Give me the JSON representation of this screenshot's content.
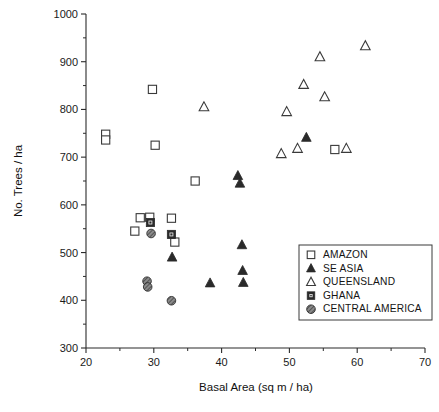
{
  "chart_data": {
    "type": "scatter",
    "title": "",
    "xlabel": "Basal Area (sq m / ha)",
    "ylabel": "No. Trees / ha",
    "xlim": [
      20,
      70
    ],
    "ylim": [
      300,
      1000
    ],
    "xticks": [
      20,
      30,
      40,
      50,
      60,
      70
    ],
    "xtick_labels": [
      "20",
      "30",
      "40",
      "50",
      "60",
      "70"
    ],
    "xminor_step": 5,
    "yticks": [
      300,
      400,
      500,
      600,
      700,
      800,
      900,
      1000
    ],
    "ytick_labels": [
      "300",
      "400",
      "500",
      "600",
      "700",
      "800",
      "900",
      "1000"
    ],
    "yminor_step": 50,
    "grid": false,
    "legend_position": "lower-right",
    "series": [
      {
        "name": "AMAZON",
        "marker": "open-square",
        "color": "#ffffff",
        "edge_color": "#3a3a3a",
        "points": [
          {
            "x": 22.9,
            "y": 748
          },
          {
            "x": 22.9,
            "y": 736
          },
          {
            "x": 29.8,
            "y": 842
          },
          {
            "x": 30.2,
            "y": 725
          },
          {
            "x": 36.1,
            "y": 650
          },
          {
            "x": 28.0,
            "y": 573
          },
          {
            "x": 29.4,
            "y": 574
          },
          {
            "x": 27.2,
            "y": 545
          },
          {
            "x": 32.6,
            "y": 572
          },
          {
            "x": 33.1,
            "y": 522
          },
          {
            "x": 56.7,
            "y": 716
          }
        ]
      },
      {
        "name": "SE ASIA",
        "marker": "filled-triangle",
        "color": "#2a2a2a",
        "edge_color": "#2a2a2a",
        "points": [
          {
            "x": 42.4,
            "y": 661
          },
          {
            "x": 42.7,
            "y": 645
          },
          {
            "x": 32.7,
            "y": 490
          },
          {
            "x": 43.0,
            "y": 516
          },
          {
            "x": 43.1,
            "y": 462
          },
          {
            "x": 43.2,
            "y": 437
          },
          {
            "x": 38.3,
            "y": 436
          },
          {
            "x": 52.5,
            "y": 741
          }
        ]
      },
      {
        "name": "QUEENSLAND",
        "marker": "open-triangle",
        "color": "#ffffff",
        "edge_color": "#3a3a3a",
        "points": [
          {
            "x": 37.4,
            "y": 805
          },
          {
            "x": 48.8,
            "y": 707
          },
          {
            "x": 49.6,
            "y": 795
          },
          {
            "x": 51.2,
            "y": 718
          },
          {
            "x": 52.1,
            "y": 852
          },
          {
            "x": 54.5,
            "y": 910
          },
          {
            "x": 55.2,
            "y": 826
          },
          {
            "x": 58.4,
            "y": 718
          },
          {
            "x": 61.2,
            "y": 933
          }
        ]
      },
      {
        "name": "GHANA",
        "marker": "filled-square",
        "color": "#2a2a2a",
        "edge_color": "#2a2a2a",
        "points": [
          {
            "x": 29.5,
            "y": 563
          },
          {
            "x": 32.6,
            "y": 538
          }
        ]
      },
      {
        "name": "CENTRAL AMERICA",
        "marker": "hatched-circle",
        "color": "#6f6f6f",
        "edge_color": "#333333",
        "points": [
          {
            "x": 29.6,
            "y": 540
          },
          {
            "x": 29.0,
            "y": 440
          },
          {
            "x": 29.1,
            "y": 428
          },
          {
            "x": 32.6,
            "y": 399
          }
        ]
      }
    ]
  },
  "legend": {
    "entries": [
      {
        "label": "AMAZON",
        "marker": "open-square"
      },
      {
        "label": "SE ASIA",
        "marker": "filled-triangle"
      },
      {
        "label": "QUEENSLAND",
        "marker": "open-triangle"
      },
      {
        "label": "GHANA",
        "marker": "filled-square"
      },
      {
        "label": "CENTRAL AMERICA",
        "marker": "hatched-circle"
      }
    ]
  }
}
